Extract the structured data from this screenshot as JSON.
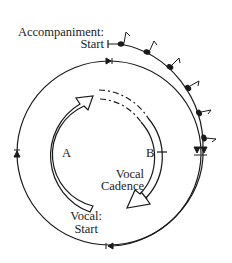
{
  "diagram": {
    "type": "cyclic-form-diagram",
    "labels": {
      "accompaniment_line1": "Accompaniment:",
      "accompaniment_line2": "Start",
      "section_a": "A",
      "section_b": "B",
      "vocal_cadence_line1": "Vocal",
      "vocal_cadence_line2": "Cadence",
      "vocal_start_line1": "Vocal:",
      "vocal_start_line2": "Start"
    },
    "elements": [
      {
        "name": "accompaniment-track",
        "description": "outer arc with eighth-note flags, starting at top"
      },
      {
        "name": "cycle-circle",
        "description": "closed circle with directional arrowheads"
      },
      {
        "name": "arrow-a",
        "description": "inner hollow arrow, section A"
      },
      {
        "name": "arrow-b",
        "description": "inner hollow arrow, section B, dashed start"
      }
    ],
    "note_count": 7,
    "stroke_color": "#1a1a1a"
  }
}
